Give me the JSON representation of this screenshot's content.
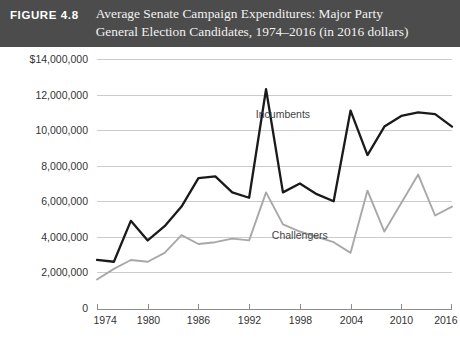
{
  "header": {
    "figure_number": "FIGURE 4.8",
    "title_line_1": "Average Senate Campaign Expenditures: Major Party",
    "title_line_2": "General Election Candidates, 1974–2016 (in 2016 dollars)",
    "bar_color": "#4c4c4c",
    "text_color": "#ffffff"
  },
  "chart_data": {
    "type": "line",
    "title": "Average Senate Campaign Expenditures: Major Party General Election Candidates, 1974–2016 (in 2016 dollars)",
    "xlabel": "",
    "ylabel": "",
    "x": [
      1974,
      1976,
      1978,
      1980,
      1982,
      1984,
      1986,
      1988,
      1990,
      1992,
      1994,
      1996,
      1998,
      2000,
      2002,
      2004,
      2006,
      2008,
      2010,
      2012,
      2014,
      2016
    ],
    "xlim": [
      1974,
      2016
    ],
    "ylim": [
      0,
      14000000
    ],
    "xticks": [
      1974,
      1980,
      1986,
      1992,
      1998,
      2004,
      2010,
      2016
    ],
    "xticklabels": [
      "1974",
      "1980",
      "1986",
      "1992",
      "1998",
      "2004",
      "2010",
      "2016"
    ],
    "yticks": [
      0,
      2000000,
      4000000,
      6000000,
      8000000,
      10000000,
      12000000,
      14000000
    ],
    "yticklabels": [
      "0",
      "2,000,000",
      "4,000,000",
      "6,000,000",
      "8,000,000",
      "10,000,000",
      "12,000,000",
      "$14,000,000"
    ],
    "grid": true,
    "legend_position": "inline-annotation",
    "series": [
      {
        "name": "Incumbents",
        "color": "#1a1a1a",
        "label_x": 1996,
        "label_y": 10700000,
        "values": [
          2700000,
          2600000,
          4900000,
          3800000,
          4600000,
          5700000,
          7300000,
          7400000,
          6500000,
          6200000,
          12300000,
          6500000,
          7000000,
          6400000,
          6000000,
          11100000,
          8600000,
          10200000,
          10800000,
          11000000,
          10900000,
          10200000
        ]
      },
      {
        "name": "Challengers",
        "color": "#a8a8a8",
        "label_x": 1998,
        "label_y": 3900000,
        "values": [
          1600000,
          2200000,
          2700000,
          2600000,
          3100000,
          4100000,
          3600000,
          3700000,
          3900000,
          3800000,
          6500000,
          4700000,
          4300000,
          4000000,
          3700000,
          3100000,
          6600000,
          4300000,
          5900000,
          7500000,
          5200000,
          5700000
        ]
      }
    ]
  }
}
